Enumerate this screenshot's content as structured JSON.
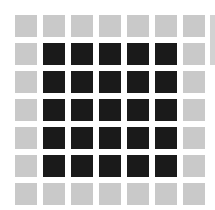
{
  "grid": {
    "rows": 7,
    "cols": 7,
    "colors": {
      "light": "#c9c9c9",
      "dark": "#1a1a1a",
      "background": "#ffffff"
    },
    "cells": [
      [
        "light",
        "light",
        "light",
        "light",
        "light",
        "light",
        "light"
      ],
      [
        "light",
        "dark",
        "dark",
        "dark",
        "dark",
        "dark",
        "light"
      ],
      [
        "light",
        "dark",
        "dark",
        "dark",
        "dark",
        "dark",
        "light"
      ],
      [
        "light",
        "dark",
        "dark",
        "dark",
        "dark",
        "dark",
        "light"
      ],
      [
        "light",
        "dark",
        "dark",
        "dark",
        "dark",
        "dark",
        "light"
      ],
      [
        "light",
        "dark",
        "dark",
        "dark",
        "dark",
        "dark",
        "light"
      ],
      [
        "light",
        "light",
        "light",
        "light",
        "light",
        "light",
        "light"
      ]
    ]
  },
  "partial_edge": {
    "color": "light"
  }
}
